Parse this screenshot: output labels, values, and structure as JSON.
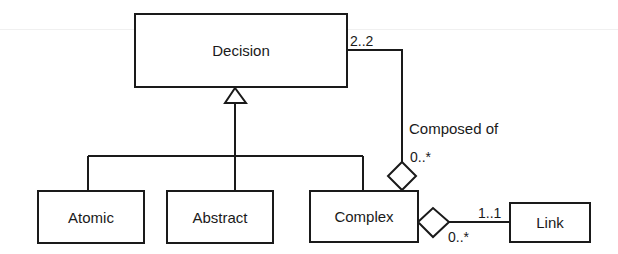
{
  "diagram": {
    "type": "uml-class-diagram",
    "classes": [
      {
        "id": "decision",
        "label": "Decision"
      },
      {
        "id": "atomic",
        "label": "Atomic"
      },
      {
        "id": "abstract",
        "label": "Abstract"
      },
      {
        "id": "complex",
        "label": "Complex"
      },
      {
        "id": "link",
        "label": "Link"
      }
    ],
    "generalization": {
      "parent": "Decision",
      "children": [
        "Atomic",
        "Abstract",
        "Complex"
      ]
    },
    "associations": [
      {
        "kind": "aggregation",
        "whole": "Complex",
        "part": "Decision",
        "name": "Composed of",
        "part_multiplicity": "2..2",
        "whole_multiplicity": "0..*"
      },
      {
        "kind": "aggregation",
        "whole": "Complex",
        "part": "Link",
        "part_multiplicity": "1..1",
        "whole_multiplicity": "0..*"
      }
    ]
  },
  "labels": {
    "decision_mult": "2..2",
    "composed_of": "Composed of",
    "complex_decision_mult": "0..*",
    "link_mult": "1..1",
    "complex_link_mult": "0..*"
  },
  "colors": {
    "stroke": "#1a1a1a",
    "background": "#ffffff"
  }
}
